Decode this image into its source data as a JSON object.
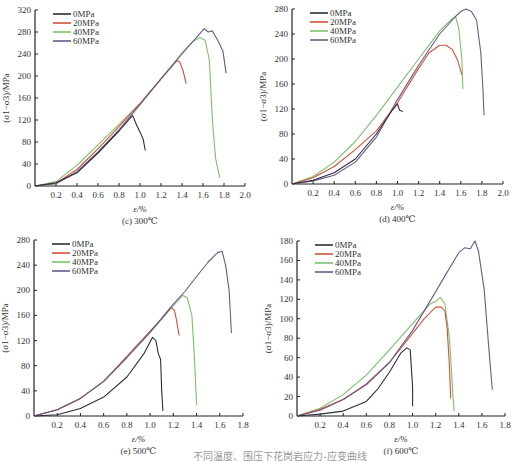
{
  "figure_caption": "不同温度、围压下花岗岩应力-应变曲线",
  "colors": {
    "0MPa": "#2e2e3a",
    "20MPa": "#d4503a",
    "40MPa": "#7cc06a",
    "60MPa": "#6a5a8a",
    "axis": "#222222"
  },
  "chart_data": [
    {
      "id": "c",
      "type": "line",
      "title": "(c) 300℃",
      "xlabel": "ε/%",
      "ylabel": "(σ1−σ3)/MPa",
      "xlim": [
        0,
        2.0
      ],
      "ylim": [
        0,
        320
      ],
      "xticks": [
        0.2,
        0.4,
        0.6,
        0.8,
        1.0,
        1.2,
        1.4,
        1.6,
        1.8,
        2.0
      ],
      "yticks": [
        0,
        40,
        80,
        120,
        160,
        200,
        240,
        280,
        320
      ],
      "grid": false,
      "legend_position": "upper-left",
      "legend": [
        "0MPa",
        "20MPa",
        "40MPa",
        "60MPa"
      ],
      "series": [
        {
          "name": "0MPa",
          "x": [
            0,
            0.2,
            0.4,
            0.6,
            0.8,
            0.9,
            0.93,
            0.97,
            1.0,
            1.03,
            1.05
          ],
          "y": [
            0,
            6,
            24,
            60,
            100,
            122,
            128,
            110,
            98,
            85,
            65
          ]
        },
        {
          "name": "20MPa",
          "x": [
            0,
            0.2,
            0.4,
            0.6,
            0.8,
            1.0,
            1.2,
            1.35,
            1.38,
            1.41,
            1.44
          ],
          "y": [
            0,
            5,
            30,
            68,
            108,
            150,
            195,
            228,
            225,
            210,
            186
          ]
        },
        {
          "name": "40MPa",
          "x": [
            0,
            0.2,
            0.4,
            0.6,
            0.8,
            1.0,
            1.2,
            1.4,
            1.5,
            1.57,
            1.62,
            1.66,
            1.69,
            1.72,
            1.76
          ],
          "y": [
            0,
            8,
            38,
            75,
            112,
            150,
            195,
            242,
            262,
            270,
            265,
            230,
            120,
            50,
            15
          ]
        },
        {
          "name": "60MPa",
          "x": [
            0,
            0.2,
            0.4,
            0.6,
            0.8,
            1.0,
            1.2,
            1.4,
            1.5,
            1.56,
            1.61,
            1.65,
            1.69,
            1.74,
            1.79,
            1.82
          ],
          "y": [
            0,
            4,
            26,
            62,
            102,
            148,
            195,
            240,
            262,
            275,
            286,
            280,
            282,
            265,
            245,
            205
          ]
        }
      ]
    },
    {
      "id": "d",
      "type": "line",
      "title": "(d) 400℃",
      "xlabel": "ε/%",
      "ylabel": "(σ1−σ3)/MPa",
      "xlim": [
        0,
        2.0
      ],
      "ylim": [
        0,
        280
      ],
      "xticks": [
        0.2,
        0.4,
        0.6,
        0.8,
        1.0,
        1.2,
        1.4,
        1.6,
        1.8,
        2.0
      ],
      "yticks": [
        0,
        40,
        80,
        120,
        160,
        200,
        240,
        280
      ],
      "grid": false,
      "legend_position": "upper-left",
      "legend": [
        "0MPa",
        "20MPa",
        "40MPa",
        "60MPa"
      ],
      "series": [
        {
          "name": "0MPa",
          "x": [
            0,
            0.2,
            0.4,
            0.6,
            0.8,
            0.95,
            1.0,
            1.02,
            1.05
          ],
          "y": [
            0,
            6,
            18,
            40,
            80,
            118,
            128,
            118,
            116
          ]
        },
        {
          "name": "20MPa",
          "x": [
            0,
            0.2,
            0.4,
            0.6,
            0.8,
            1.0,
            1.2,
            1.3,
            1.4,
            1.46,
            1.52,
            1.57,
            1.61
          ],
          "y": [
            0,
            10,
            28,
            55,
            85,
            130,
            185,
            210,
            222,
            222,
            215,
            198,
            175
          ]
        },
        {
          "name": "40MPa",
          "x": [
            0,
            0.2,
            0.4,
            0.6,
            0.8,
            1.0,
            1.2,
            1.4,
            1.5,
            1.55,
            1.58,
            1.61,
            1.62
          ],
          "y": [
            0,
            12,
            35,
            68,
            110,
            155,
            200,
            245,
            262,
            268,
            250,
            200,
            152
          ]
        },
        {
          "name": "60MPa",
          "x": [
            0,
            0.2,
            0.4,
            0.6,
            0.8,
            1.0,
            1.2,
            1.4,
            1.55,
            1.6,
            1.65,
            1.7,
            1.75,
            1.79,
            1.81,
            1.82
          ],
          "y": [
            0,
            5,
            14,
            35,
            75,
            135,
            190,
            240,
            268,
            276,
            280,
            276,
            262,
            210,
            150,
            110
          ]
        }
      ]
    },
    {
      "id": "e",
      "type": "line",
      "title": "(e) 500℃",
      "xlabel": "ε/%",
      "ylabel": "(σ1−σ3)/MPa",
      "xlim": [
        0,
        1.8
      ],
      "ylim": [
        0,
        280
      ],
      "xticks": [
        0.2,
        0.4,
        0.6,
        0.8,
        1.0,
        1.2,
        1.4,
        1.6,
        1.8
      ],
      "yticks": [
        0,
        40,
        80,
        120,
        160,
        200,
        240,
        280
      ],
      "grid": false,
      "legend_position": "upper-left",
      "legend": [
        "0MPa",
        "20MPa",
        "40MPa",
        "60MPa"
      ],
      "series": [
        {
          "name": "0MPa",
          "x": [
            0,
            0.2,
            0.4,
            0.6,
            0.8,
            0.95,
            1.02,
            1.05,
            1.07,
            1.09,
            1.1,
            1.11
          ],
          "y": [
            0,
            2,
            12,
            30,
            62,
            100,
            125,
            120,
            100,
            90,
            40,
            8
          ]
        },
        {
          "name": "20MPa",
          "x": [
            0,
            0.2,
            0.4,
            0.6,
            0.8,
            1.0,
            1.1,
            1.18,
            1.21,
            1.23,
            1.25
          ],
          "y": [
            0,
            10,
            28,
            55,
            95,
            135,
            155,
            173,
            168,
            150,
            128
          ]
        },
        {
          "name": "40MPa",
          "x": [
            0,
            0.2,
            0.4,
            0.6,
            0.8,
            1.0,
            1.2,
            1.28,
            1.32,
            1.36,
            1.38,
            1.4
          ],
          "y": [
            0,
            10,
            28,
            55,
            93,
            133,
            175,
            192,
            188,
            160,
            100,
            18
          ]
        },
        {
          "name": "60MPa",
          "x": [
            0,
            0.2,
            0.4,
            0.6,
            0.8,
            1.0,
            1.2,
            1.3,
            1.4,
            1.5,
            1.58,
            1.62,
            1.65,
            1.68,
            1.7
          ],
          "y": [
            0,
            10,
            28,
            55,
            93,
            133,
            178,
            198,
            222,
            245,
            260,
            262,
            240,
            200,
            132
          ]
        }
      ]
    },
    {
      "id": "f",
      "type": "line",
      "title": "(f) 600℃",
      "xlabel": "ε/%",
      "ylabel": "(σ1−σ3)/MPa",
      "xlim": [
        0,
        1.8
      ],
      "ylim": [
        0,
        180
      ],
      "xticks": [
        0.2,
        0.4,
        0.6,
        0.8,
        1.0,
        1.2,
        1.4,
        1.6,
        1.8
      ],
      "yticks": [
        0,
        20,
        40,
        60,
        80,
        100,
        120,
        140,
        160,
        180
      ],
      "grid": false,
      "legend_position": "upper-left",
      "legend": [
        "0MPa",
        "20MPa",
        "40MPa",
        "60MPa"
      ],
      "series": [
        {
          "name": "0MPa",
          "x": [
            0,
            0.2,
            0.4,
            0.6,
            0.7,
            0.8,
            0.9,
            0.95,
            0.98,
            1.0,
            1.0
          ],
          "y": [
            0,
            2,
            5,
            15,
            28,
            45,
            65,
            70,
            68,
            30,
            10
          ]
        },
        {
          "name": "20MPa",
          "x": [
            0,
            0.2,
            0.4,
            0.6,
            0.8,
            1.0,
            1.1,
            1.2,
            1.25,
            1.28,
            1.3,
            1.32,
            1.33
          ],
          "y": [
            0,
            7,
            17,
            33,
            55,
            85,
            100,
            112,
            112,
            108,
            90,
            50,
            18
          ]
        },
        {
          "name": "40MPa",
          "x": [
            0,
            0.2,
            0.4,
            0.6,
            0.8,
            1.0,
            1.15,
            1.2,
            1.24,
            1.28,
            1.32,
            1.35,
            1.36
          ],
          "y": [
            0,
            8,
            22,
            42,
            68,
            95,
            115,
            118,
            122,
            115,
            80,
            20,
            5
          ]
        },
        {
          "name": "60MPa",
          "x": [
            0,
            0.2,
            0.4,
            0.6,
            0.8,
            1.0,
            1.2,
            1.3,
            1.4,
            1.45,
            1.5,
            1.54,
            1.57,
            1.62,
            1.66,
            1.69
          ],
          "y": [
            0,
            6,
            17,
            32,
            55,
            88,
            128,
            148,
            168,
            173,
            172,
            180,
            170,
            130,
            70,
            27
          ]
        }
      ]
    }
  ]
}
